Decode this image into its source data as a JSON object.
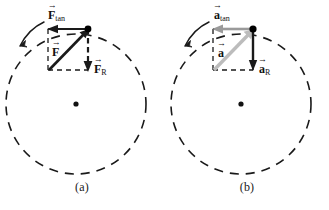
{
  "figure": {
    "background_color": "#ffffff",
    "panels": [
      {
        "id": "a",
        "caption": "(a)",
        "quantity": "force",
        "circle": {
          "style": "dashed",
          "stroke_color": "#1a1a1a",
          "center_dot": true
        },
        "rotation_arrow": {
          "name": "counterclockwise-motion-arrow",
          "direction": "counterclockwise",
          "color": "#1a1a1a"
        },
        "particle_dot": {
          "color": "#000000"
        },
        "vectors": [
          {
            "name": "resultant-force-vector",
            "symbol": "F",
            "accent": "→",
            "subscript": "",
            "label_text": "F",
            "color": "#1a1a1a",
            "style": "solid",
            "role": "resultant"
          },
          {
            "name": "tangential-force-vector",
            "symbol": "F",
            "accent": "→",
            "subscript": "tan",
            "label_text": "Ftan",
            "color": "#1a1a1a",
            "style": "solid",
            "role": "tangential"
          },
          {
            "name": "radial-force-vector",
            "symbol": "F",
            "accent": "→",
            "subscript": "R",
            "label_text": "FR",
            "color": "#1a1a1a",
            "style": "dashed",
            "role": "radial"
          }
        ],
        "construction_box": {
          "style": "dashed",
          "color": "#1a1a1a"
        }
      },
      {
        "id": "b",
        "caption": "(b)",
        "quantity": "acceleration",
        "circle": {
          "style": "dashed",
          "stroke_color": "#1a1a1a",
          "center_dot": true
        },
        "rotation_arrow": {
          "name": "counterclockwise-motion-arrow",
          "direction": "counterclockwise",
          "color": "#1a1a1a"
        },
        "particle_dot": {
          "color": "#000000"
        },
        "vectors": [
          {
            "name": "resultant-acceleration-vector",
            "symbol": "a",
            "accent": "→",
            "subscript": "",
            "label_text": "a",
            "color": "#bcbcbc",
            "style": "solid",
            "role": "resultant"
          },
          {
            "name": "tangential-acceleration-vector",
            "symbol": "a",
            "accent": "→",
            "subscript": "tan",
            "label_text": "atan",
            "color": "#9a9a9a",
            "style": "solid",
            "role": "tangential"
          },
          {
            "name": "radial-acceleration-vector",
            "symbol": "a",
            "accent": "→",
            "subscript": "R",
            "label_text": "aR",
            "color": "#1a1a1a",
            "style": "solid",
            "role": "radial"
          }
        ],
        "construction_box": {
          "style": "dashed",
          "color": "#1a1a1a"
        }
      }
    ]
  }
}
